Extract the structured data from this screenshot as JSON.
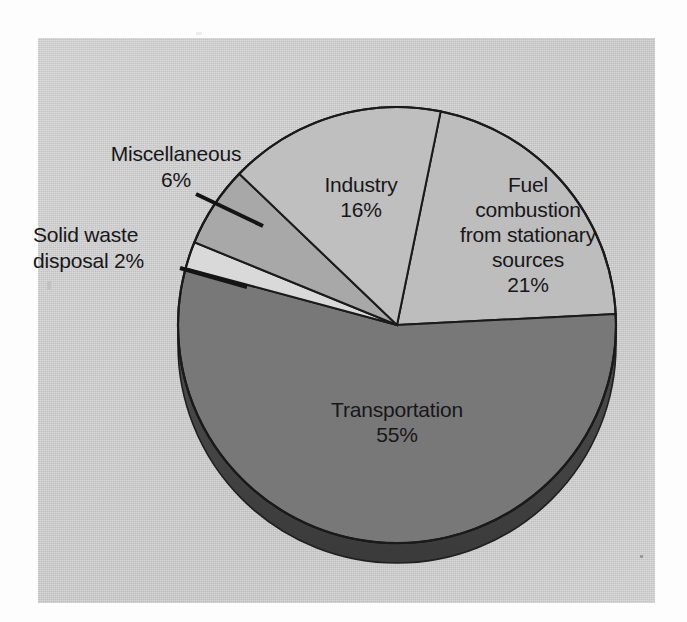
{
  "figure": {
    "kind": "pie-chart-scan",
    "background_color": "#fdfdfd",
    "panel_color": "#c8c8c8"
  },
  "chart_data": {
    "type": "pie",
    "title": "",
    "subtitle": "",
    "xlabel": "",
    "ylabel": "",
    "legend_position": "none",
    "grid": false,
    "style": "3d-pie",
    "units": "percent",
    "total": 100,
    "categories": [
      "Fuel combustion from stationary sources",
      "Transportation",
      "Solid waste disposal",
      "Miscellaneous",
      "Industry"
    ],
    "values": [
      21,
      55,
      2,
      6,
      16
    ],
    "slices": [
      {
        "name": "fuel-combustion",
        "label": "Fuel\ncombustion\nfrom stationary\nsources",
        "value_text": "21%",
        "value": 21,
        "color": "#bdbdbd",
        "label_placement": "inside"
      },
      {
        "name": "transportation",
        "label": "Transportation",
        "value_text": "55%",
        "value": 55,
        "color": "#787878",
        "label_placement": "inside"
      },
      {
        "name": "solid-waste-disposal",
        "label": "Solid waste\ndisposal 2%",
        "value_text": "2%",
        "value": 2,
        "color": "#d9d9d9",
        "label_placement": "callout"
      },
      {
        "name": "miscellaneous",
        "label": "Miscellaneous",
        "value_text": "6%",
        "value": 6,
        "color": "#a8a8a8",
        "label_placement": "callout"
      },
      {
        "name": "industry",
        "label": "Industry",
        "value_text": "16%",
        "value": 16,
        "color": "#bfbfbf",
        "label_placement": "inside"
      }
    ]
  },
  "labels": {
    "transportation": "Transportation\n55%",
    "industry": "Industry\n16%",
    "fuel": "Fuel\ncombustion\nfrom stationary\nsources\n21%",
    "miscellaneous": "Miscellaneous\n6%",
    "solid_waste": "Solid waste\ndisposal 2%"
  }
}
